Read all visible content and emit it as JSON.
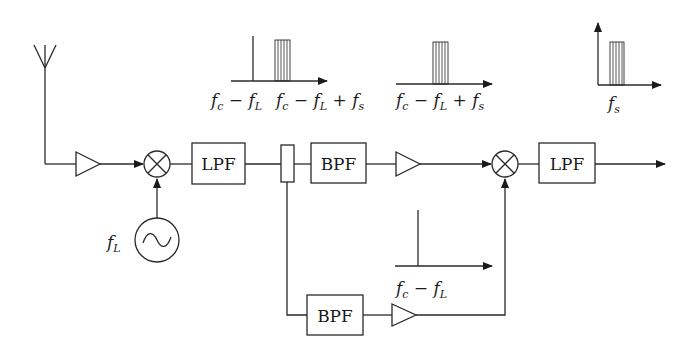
{
  "diagram": {
    "type": "receiver block diagram",
    "blocks": {
      "lpf1": "LPF",
      "bpf1": "BPF",
      "bpf2": "BPF",
      "lpf2": "LPF"
    },
    "labels": {
      "local_oscillator": {
        "main": "f",
        "sub": "L"
      },
      "spectrum1_left": {
        "parts": [
          "f",
          "c",
          " − ",
          "f",
          "L"
        ]
      },
      "spectrum1_right": {
        "parts": [
          "f",
          "c",
          " − ",
          "f",
          "L",
          " + ",
          "f",
          "s"
        ]
      },
      "spectrum2": {
        "parts": [
          "f",
          "c",
          " − ",
          "f",
          "L",
          " + ",
          "f",
          "s"
        ]
      },
      "spectrum3": {
        "main": "f",
        "sub": "s"
      },
      "spectrum_pilot": {
        "parts": [
          "f",
          "c",
          " − ",
          "f",
          "L"
        ]
      }
    },
    "components": [
      "antenna",
      "amplifier",
      "mixer",
      "local-oscillator",
      "LPF",
      "splitter",
      "BPF",
      "amplifier",
      "mixer",
      "LPF",
      "BPF",
      "amplifier"
    ],
    "colors": {
      "stroke": "#2a2a2a",
      "background": "#ffffff"
    }
  }
}
